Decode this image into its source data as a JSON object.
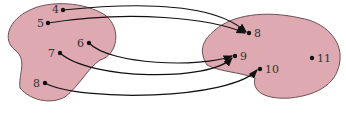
{
  "diagram": {
    "type": "function-mapping",
    "colors": {
      "set_fill": "#dfa9b2",
      "set_stroke": "#6b5055",
      "arrow": "#111111"
    },
    "domain_set": {
      "elements": [
        {
          "label": "4",
          "x": 63,
          "y": 10
        },
        {
          "label": "5",
          "x": 48,
          "y": 23
        },
        {
          "label": "6",
          "x": 89,
          "y": 43
        },
        {
          "label": "7",
          "x": 60,
          "y": 53
        },
        {
          "label": "8",
          "x": 45,
          "y": 83
        }
      ]
    },
    "codomain_set": {
      "elements": [
        {
          "label": "8",
          "x": 249,
          "y": 33
        },
        {
          "label": "9",
          "x": 235,
          "y": 56
        },
        {
          "label": "10",
          "x": 260,
          "y": 69
        },
        {
          "label": "11",
          "x": 312,
          "y": 58
        }
      ]
    },
    "mappings": [
      {
        "from": "4",
        "to": "8"
      },
      {
        "from": "5",
        "to": "8"
      },
      {
        "from": "6",
        "to": "9"
      },
      {
        "from": "7",
        "to": "9"
      },
      {
        "from": "8",
        "to": "10"
      }
    ]
  }
}
